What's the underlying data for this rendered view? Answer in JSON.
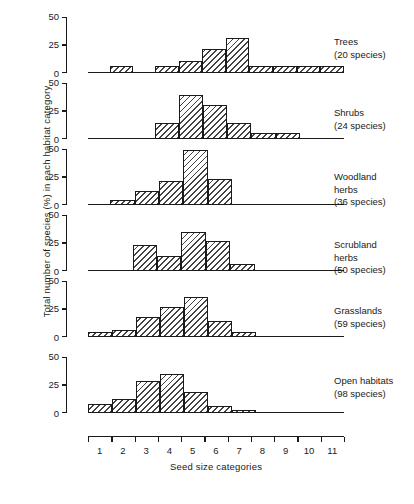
{
  "chart_data": {
    "type": "bar",
    "title": "",
    "subtitle": "",
    "xlabel": "Seed size categories",
    "ylabel": "Total number of species (%) in each habitat category",
    "categories": [
      "1",
      "2",
      "3",
      "4",
      "5",
      "6",
      "7",
      "8",
      "9",
      "10",
      "11"
    ],
    "ylim": [
      0,
      50
    ],
    "yticks": [
      0,
      25,
      50
    ],
    "ytick_labels": [
      "0",
      "25",
      "50"
    ],
    "grid": false,
    "legend_position": "right-of-each-panel",
    "panels": [
      {
        "name": "Trees",
        "label_line1": "Trees",
        "label_line2": "(20 species)",
        "species_count": 20,
        "values": [
          0,
          5,
          0,
          5,
          10,
          20,
          30,
          5,
          5,
          5,
          5
        ]
      },
      {
        "name": "Shrubs",
        "label_line1": "Shrubs",
        "label_line2": "(24 species)",
        "species_count": 24,
        "values": [
          0,
          0,
          0,
          13,
          38,
          29,
          13,
          4,
          4,
          0,
          0
        ]
      },
      {
        "name": "Woodland herbs",
        "label_line1": "Woodland",
        "label_line2": "herbs",
        "label_line3": "(36 species)",
        "species_count": 36,
        "values": [
          0,
          3,
          11,
          20,
          48,
          22,
          0,
          0,
          0,
          0,
          0
        ]
      },
      {
        "name": "Scrubland herbs",
        "label_line1": "Scrubland",
        "label_line2": "herbs",
        "label_line3": "(50 species)",
        "species_count": 50,
        "values": [
          0,
          0,
          22,
          12,
          34,
          26,
          5,
          0,
          0,
          0,
          0
        ]
      },
      {
        "name": "Grasslands",
        "label_line1": "Grasslands",
        "label_line2": "(59 species)",
        "species_count": 59,
        "values": [
          3,
          5,
          17,
          26,
          35,
          13,
          3,
          0,
          0,
          0,
          0
        ]
      },
      {
        "name": "Open habitats",
        "label_line1": "Open habitats",
        "label_line2": "(98 species)",
        "species_count": 98,
        "values": [
          7,
          11,
          27,
          34,
          18,
          5,
          1,
          0,
          0,
          0,
          0
        ]
      }
    ],
    "colors": {
      "ink": "#1a1a1a",
      "background": "#ffffff",
      "bar_hatch": "#1a1a1a"
    }
  }
}
